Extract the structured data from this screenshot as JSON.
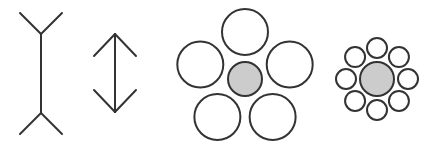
{
  "figure": {
    "stroke_color": "#333333",
    "fill_gray": "#cccccc",
    "fill_white": "#ffffff",
    "muller_lyer": [
      {
        "name": "fins-out-line",
        "x": 41,
        "y1": 34,
        "y2": 113,
        "fin_dx": 21,
        "fin_dy": -21
      },
      {
        "name": "arrowheads-line",
        "x": 115,
        "y1": 34,
        "y2": 112,
        "fin_dx": 21,
        "fin_dy": 22
      }
    ],
    "ebbinghaus": [
      {
        "name": "large-surround",
        "cx": 245,
        "cy": 79,
        "center_r": 17,
        "ring_r": 47,
        "ring_circle_r": 23,
        "count": 5,
        "start_angle": -90
      },
      {
        "name": "small-surround",
        "cx": 377,
        "cy": 79,
        "center_r": 17,
        "ring_r": 31,
        "ring_circle_r": 10,
        "count": 8,
        "start_angle": -90
      }
    ]
  }
}
